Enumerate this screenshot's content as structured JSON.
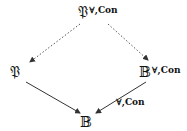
{
  "nodes": {
    "top": {
      "base": "𝔓",
      "sup": "∀,Con"
    },
    "left": {
      "base": "𝔓"
    },
    "right": {
      "base": "𝔹",
      "sup": "∀,Con"
    },
    "bottom": {
      "base": "𝔹"
    }
  },
  "edges": [
    {
      "from": "top",
      "to": "left",
      "style": "dotted"
    },
    {
      "from": "top",
      "to": "right",
      "style": "dotted"
    },
    {
      "from": "left",
      "to": "bottom",
      "style": "solid"
    },
    {
      "from": "right",
      "to": "bottom",
      "style": "solid",
      "label": "∀,Con"
    }
  ]
}
